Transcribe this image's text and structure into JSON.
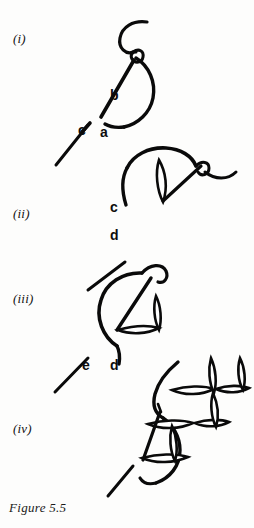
{
  "figure": {
    "caption": "Figure 5.5",
    "background_color": "#fdfdfc",
    "ink_color": "#0a0a0a"
  },
  "panels": [
    {
      "id": "i",
      "label": "(i)",
      "point_labels": [
        "a",
        "b",
        "c"
      ]
    },
    {
      "id": "ii",
      "label": "(ii)",
      "point_labels": [
        "c",
        "d"
      ]
    },
    {
      "id": "iii",
      "label": "(iii)",
      "point_labels": [
        "d",
        "e"
      ]
    },
    {
      "id": "iv",
      "label": "(iv)",
      "point_labels": []
    }
  ],
  "labels": {
    "panel_i": "(i)",
    "panel_ii": "(ii)",
    "panel_iii": "(iii)",
    "panel_iv": "(iv)",
    "a": "a",
    "b": "b",
    "c_panel_i": "c",
    "c_panel_ii": "c",
    "d_panel_ii": "d",
    "d_panel_iii": "d",
    "e_panel_iii": "e"
  }
}
